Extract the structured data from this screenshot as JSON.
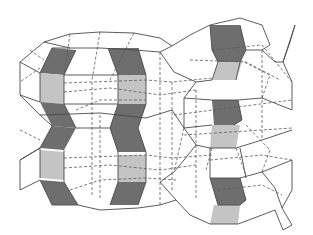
{
  "diagram": {
    "colors": {
      "background": "#ffffff",
      "edge": "#4a4a4a",
      "hidden_edge": "#5a5a5a",
      "dark_face": "#6e6e6e",
      "light_face": "#c4c4c4"
    },
    "components": [
      {
        "name": "left-cage-stack",
        "type": "two stacked barrel-shaped cages with shaded vertical columns"
      },
      {
        "name": "right-cage-stack",
        "type": "stacked hexagonal-prism cages with one shaded zigzag column"
      },
      {
        "name": "right-connector-spikes",
        "type": "Y-shaped linkers on right edge"
      }
    ]
  }
}
